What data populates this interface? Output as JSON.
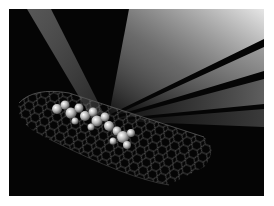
{
  "image": {
    "subject": "carbon nanotube with encapsulated molecules illuminated by light beams",
    "palette": {
      "background": "#050505",
      "beam": "#e8e8e8",
      "lattice": "#6a6a6a",
      "molecule": "#d8d8d8",
      "border": "#ffffff"
    }
  }
}
